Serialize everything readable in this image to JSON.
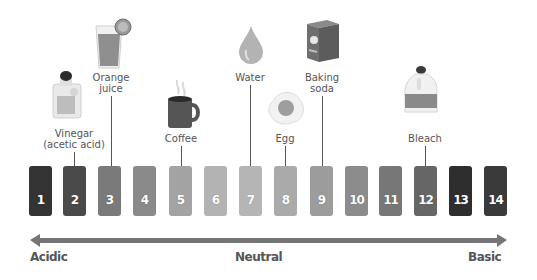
{
  "scale": {
    "boxes": [
      {
        "value": "1",
        "color": "#333333"
      },
      {
        "value": "2",
        "color": "#4a4a4a"
      },
      {
        "value": "3",
        "color": "#7a7a7a"
      },
      {
        "value": "4",
        "color": "#8a8a8a"
      },
      {
        "value": "5",
        "color": "#a3a3a3"
      },
      {
        "value": "6",
        "color": "#b3b3b3"
      },
      {
        "value": "7",
        "color": "#b5b5b5"
      },
      {
        "value": "8",
        "color": "#aaaaaa"
      },
      {
        "value": "9",
        "color": "#9c9c9c"
      },
      {
        "value": "10",
        "color": "#8c8c8c"
      },
      {
        "value": "11",
        "color": "#777777"
      },
      {
        "value": "12",
        "color": "#666666"
      },
      {
        "value": "13",
        "color": "#2e2e2e"
      },
      {
        "value": "14",
        "color": "#3a3a3a"
      }
    ]
  },
  "substances": [
    {
      "name": "Vinegar (acetic acid)",
      "line1": "Vinegar",
      "line2": "(acetic acid)",
      "ph": 2,
      "icon": "vinegar-bottle-icon"
    },
    {
      "name": "Orange juice",
      "line1": "Orange",
      "line2": "juice",
      "ph": 3,
      "icon": "orange-juice-icon"
    },
    {
      "name": "Coffee",
      "line1": "Coffee",
      "ph": 5,
      "icon": "coffee-mug-icon"
    },
    {
      "name": "Water",
      "line1": "Water",
      "ph": 7,
      "icon": "water-drop-icon"
    },
    {
      "name": "Egg",
      "line1": "Egg",
      "ph": 8,
      "icon": "fried-egg-icon"
    },
    {
      "name": "Baking soda",
      "line1": "Baking",
      "line2": "soda",
      "ph": 9,
      "icon": "baking-soda-box-icon"
    },
    {
      "name": "Bleach",
      "line1": "Bleach",
      "ph": 12,
      "icon": "bleach-jug-icon"
    }
  ],
  "axis": {
    "left_label": "Acidic",
    "center_label": "Neutral",
    "right_label": "Basic",
    "color": "#757575"
  }
}
